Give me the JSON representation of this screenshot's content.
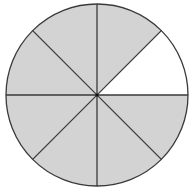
{
  "diagram": {
    "type": "fraction-circle",
    "total_parts": 8,
    "shaded_parts": 7,
    "unshaded_parts": 1,
    "unshaded_sector_index": 0,
    "center": [
      97,
      95
    ],
    "radius": 91,
    "colors": {
      "shaded": "#d3d3d3",
      "unshaded": "#ffffff",
      "stroke": "#3a3a3a"
    }
  },
  "chart_data": {
    "type": "pie",
    "title": "",
    "categories": [
      "1",
      "2",
      "3",
      "4",
      "5",
      "6",
      "7",
      "8"
    ],
    "values": [
      1,
      1,
      1,
      1,
      1,
      1,
      1,
      1
    ],
    "shaded": [
      false,
      true,
      true,
      true,
      true,
      true,
      true,
      true
    ]
  }
}
